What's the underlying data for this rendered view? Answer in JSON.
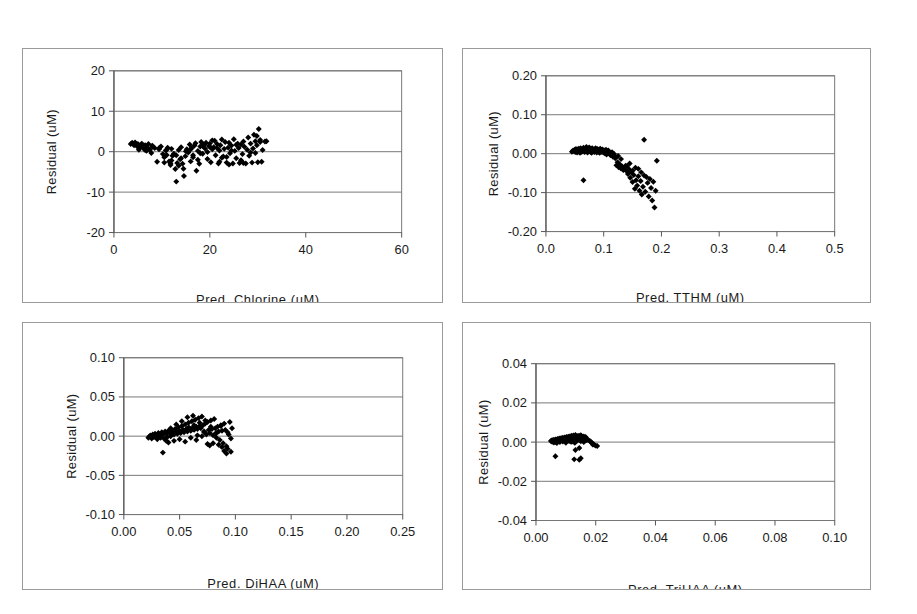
{
  "figure": {
    "background": "#ffffff",
    "panel_border_color": "#9a9a9a",
    "axis_color": "#555555",
    "gridline_color": "#777777",
    "marker_color": "#000000",
    "panel_count": 4
  },
  "chart_data": [
    {
      "id": "panel-chlorine",
      "type": "scatter",
      "title": "",
      "xlabel": "Pred. Chlorine (uM)",
      "ylabel": "Residual (uM)",
      "xlim": [
        0,
        60
      ],
      "ylim": [
        -20,
        20
      ],
      "xticks": [
        0,
        20,
        40,
        60
      ],
      "xticklabels": [
        "0",
        "20",
        "40",
        "60"
      ],
      "yticks": [
        -20,
        -10,
        0,
        10,
        20
      ],
      "yticklabels": [
        "-20",
        "-10",
        "0",
        "10",
        "20"
      ],
      "grid": "horizontal",
      "legend": "none",
      "x": [
        3.5,
        3.8,
        4.0,
        4.2,
        4.4,
        4.6,
        4.8,
        5.0,
        5.2,
        5.5,
        5.8,
        6.0,
        6.2,
        6.5,
        6.8,
        7.0,
        7.2,
        7.5,
        7.8,
        8.0,
        8.5,
        9.0,
        9.4,
        9.8,
        10.2,
        10.5,
        10.8,
        11.0,
        11.2,
        11.5,
        11.8,
        12.0,
        12.2,
        12.5,
        12.8,
        13.0,
        13.2,
        13.5,
        13.8,
        14.0,
        14.3,
        14.6,
        14.9,
        15.2,
        15.5,
        15.8,
        16.0,
        16.2,
        16.5,
        16.8,
        17.0,
        17.2,
        17.5,
        17.8,
        18.0,
        18.2,
        18.5,
        18.8,
        19.0,
        19.2,
        19.5,
        19.8,
        20.0,
        20.2,
        20.5,
        20.8,
        21.0,
        21.2,
        21.5,
        21.8,
        22.0,
        22.2,
        22.5,
        22.8,
        23.0,
        23.2,
        23.5,
        23.8,
        24.0,
        24.2,
        24.5,
        24.8,
        25.0,
        25.2,
        25.5,
        25.8,
        26.0,
        26.2,
        26.5,
        26.8,
        27.0,
        27.2,
        27.5,
        27.8,
        28.0,
        28.2,
        28.5,
        28.8,
        29.0,
        29.2,
        29.5,
        29.8,
        30.0,
        30.2,
        30.5,
        30.8,
        31.0,
        31.5,
        12.0,
        12.5,
        13.5,
        14.5,
        10.5,
        11.8,
        15.0,
        16.5,
        18.5,
        20.5,
        22.5,
        24.5,
        26.5,
        28.5,
        29.5,
        25.5,
        23.5,
        21.5,
        19.5,
        17.5,
        29.8,
        30.5,
        31.8,
        27.0,
        24.0,
        22.0,
        20.0,
        18.0,
        16.0,
        14.0,
        13.0,
        11.0,
        9.5,
        8.0,
        6.5,
        5.0,
        4.5
      ],
      "y": [
        1.9,
        2.2,
        2.0,
        1.6,
        2.3,
        1.8,
        1.4,
        1.9,
        0.5,
        1.1,
        2.0,
        1.3,
        0.8,
        1.6,
        0.2,
        1.0,
        1.9,
        0.4,
        -0.3,
        1.2,
        0.9,
        -2.5,
        0.6,
        1.3,
        -0.6,
        -1.4,
        0.3,
        -0.8,
        1.0,
        -2.4,
        -3.3,
        0.7,
        -1.0,
        -0.5,
        -4.3,
        -7.4,
        -2.8,
        0.4,
        -1.9,
        1.1,
        -3.0,
        -6.0,
        -1.1,
        0.6,
        -0.2,
        1.8,
        -2.4,
        0.9,
        -1.4,
        1.5,
        2.1,
        -4.7,
        0.2,
        -3.0,
        1.3,
        2.4,
        -0.5,
        1.7,
        0.8,
        2.2,
        -1.8,
        1.4,
        2.0,
        -2.6,
        0.6,
        1.1,
        2.7,
        -0.9,
        1.9,
        -2.9,
        0.3,
        1.6,
        3.0,
        -1.2,
        0.7,
        2.4,
        -2.7,
        1.0,
        2.2,
        -0.4,
        1.5,
        -2.9,
        3.1,
        0.2,
        -1.6,
        2.0,
        0.9,
        -2.8,
        1.8,
        -0.6,
        2.5,
        1.2,
        -2.9,
        0.5,
        3.5,
        -1.0,
        2.0,
        -2.7,
        0.8,
        4.2,
        -0.3,
        1.6,
        -2.6,
        5.6,
        2.9,
        -2.5,
        0.4,
        2.5,
        -2.2,
        -0.7,
        -3.5,
        -4.2,
        -2.7,
        -2.9,
        0.1,
        -0.9,
        1.4,
        2.8,
        -1.5,
        0.3,
        -2.1,
        -0.2,
        2.6,
        1.7,
        -1.3,
        0.9,
        -0.1,
        -2.0,
        3.9,
        2.4,
        2.6,
        -2.8,
        -3.2,
        -2.5,
        1.2,
        -0.4,
        0.6,
        -1.6,
        -0.9,
        0.5,
        1.0,
        1.5,
        0.4,
        1.2,
        2.1
      ],
      "marker": "diamond",
      "marker_size": 3
    },
    {
      "id": "panel-tthm",
      "type": "scatter",
      "title": "",
      "xlabel": "Pred. TTHM (uM)",
      "ylabel": "Residual (uM)",
      "xlim": [
        0.0,
        0.5
      ],
      "ylim": [
        -0.2,
        0.2
      ],
      "xticks": [
        0.0,
        0.1,
        0.2,
        0.3,
        0.4,
        0.5
      ],
      "xticklabels": [
        "0.0",
        "0.1",
        "0.2",
        "0.3",
        "0.4",
        "0.5"
      ],
      "yticks": [
        -0.2,
        -0.1,
        0.0,
        0.1,
        0.2
      ],
      "yticklabels": [
        "-0.20",
        "-0.10",
        "0.00",
        "0.10",
        "0.20"
      ],
      "grid": "horizontal",
      "legend": "none",
      "x": [
        0.045,
        0.047,
        0.049,
        0.05,
        0.051,
        0.052,
        0.053,
        0.054,
        0.055,
        0.056,
        0.057,
        0.058,
        0.059,
        0.06,
        0.061,
        0.062,
        0.063,
        0.064,
        0.065,
        0.066,
        0.067,
        0.068,
        0.069,
        0.07,
        0.071,
        0.072,
        0.073,
        0.074,
        0.075,
        0.076,
        0.077,
        0.078,
        0.079,
        0.08,
        0.081,
        0.082,
        0.083,
        0.084,
        0.085,
        0.086,
        0.087,
        0.088,
        0.089,
        0.09,
        0.091,
        0.092,
        0.093,
        0.094,
        0.095,
        0.096,
        0.097,
        0.098,
        0.099,
        0.1,
        0.101,
        0.102,
        0.103,
        0.104,
        0.105,
        0.106,
        0.107,
        0.108,
        0.11,
        0.112,
        0.114,
        0.116,
        0.118,
        0.12,
        0.122,
        0.124,
        0.126,
        0.128,
        0.13,
        0.132,
        0.134,
        0.136,
        0.138,
        0.14,
        0.142,
        0.144,
        0.146,
        0.148,
        0.15,
        0.152,
        0.154,
        0.156,
        0.158,
        0.16,
        0.162,
        0.164,
        0.166,
        0.168,
        0.17,
        0.172,
        0.174,
        0.176,
        0.178,
        0.18,
        0.182,
        0.184,
        0.186,
        0.188,
        0.19,
        0.192,
        0.155,
        0.145,
        0.135,
        0.125,
        0.115,
        0.105,
        0.095,
        0.085,
        0.075,
        0.065,
        0.17,
        0.165,
        0.16,
        0.15,
        0.14,
        0.13,
        0.12,
        0.11,
        0.1,
        0.09,
        0.08,
        0.07,
        0.06,
        0.055
      ],
      "y": [
        0.005,
        0.008,
        0.006,
        0.01,
        0.004,
        0.012,
        0.007,
        0.003,
        0.011,
        0.006,
        0.013,
        0.008,
        0.002,
        0.014,
        0.009,
        0.005,
        0.012,
        0.007,
        0.015,
        0.01,
        0.004,
        0.013,
        0.008,
        0.006,
        0.011,
        0.003,
        0.014,
        0.009,
        0.007,
        0.012,
        0.005,
        0.01,
        0.002,
        0.013,
        0.008,
        0.006,
        0.011,
        0.004,
        0.009,
        0.014,
        0.007,
        0.003,
        0.012,
        0.008,
        0.005,
        0.01,
        0.002,
        0.013,
        0.006,
        0.009,
        0.004,
        0.011,
        0.007,
        0.003,
        0.008,
        0.001,
        0.005,
        0.01,
        -0.002,
        0.006,
        0.002,
        0.008,
        0.0,
        -0.004,
        0.003,
        -0.008,
        -0.001,
        -0.012,
        -0.03,
        -0.022,
        -0.035,
        -0.028,
        -0.038,
        -0.033,
        -0.042,
        -0.036,
        -0.031,
        -0.045,
        -0.052,
        -0.04,
        -0.062,
        -0.048,
        -0.073,
        -0.055,
        -0.09,
        -0.068,
        -0.082,
        -0.058,
        -0.095,
        -0.07,
        -0.105,
        -0.085,
        0.036,
        -0.098,
        -0.06,
        -0.075,
        -0.11,
        -0.065,
        -0.088,
        -0.12,
        -0.072,
        -0.138,
        -0.095,
        -0.018,
        -0.036,
        -0.025,
        -0.041,
        -0.006,
        0.003,
        0.001,
        0.009,
        0.012,
        0.016,
        -0.068,
        -0.056,
        -0.048,
        -0.039,
        -0.044,
        -0.032,
        -0.014,
        -0.009,
        0.002,
        0.007,
        0.01,
        0.014,
        0.017,
        0.011
      ],
      "marker": "diamond",
      "marker_size": 3
    },
    {
      "id": "panel-dihaa",
      "type": "scatter",
      "title": "",
      "xlabel": "Pred. DiHAA (uM)",
      "ylabel": "Residual (uM)",
      "xlim": [
        0.0,
        0.25
      ],
      "ylim": [
        -0.1,
        0.1
      ],
      "xticks": [
        0.0,
        0.05,
        0.1,
        0.15,
        0.2,
        0.25
      ],
      "xticklabels": [
        "0.00",
        "0.05",
        "0.10",
        "0.15",
        "0.20",
        "0.25"
      ],
      "yticks": [
        -0.1,
        -0.05,
        0.0,
        0.05,
        0.1
      ],
      "yticklabels": [
        "-0.10",
        "-0.05",
        "0.00",
        "0.05",
        "0.10"
      ],
      "grid": "horizontal",
      "legend": "none",
      "x": [
        0.022,
        0.023,
        0.024,
        0.025,
        0.026,
        0.027,
        0.028,
        0.029,
        0.03,
        0.031,
        0.032,
        0.033,
        0.034,
        0.035,
        0.036,
        0.037,
        0.038,
        0.039,
        0.04,
        0.041,
        0.042,
        0.043,
        0.044,
        0.045,
        0.046,
        0.047,
        0.048,
        0.049,
        0.05,
        0.051,
        0.052,
        0.053,
        0.054,
        0.055,
        0.056,
        0.057,
        0.058,
        0.059,
        0.06,
        0.061,
        0.062,
        0.063,
        0.064,
        0.065,
        0.066,
        0.067,
        0.068,
        0.069,
        0.07,
        0.071,
        0.072,
        0.073,
        0.074,
        0.075,
        0.076,
        0.077,
        0.078,
        0.079,
        0.08,
        0.081,
        0.082,
        0.083,
        0.084,
        0.085,
        0.086,
        0.087,
        0.088,
        0.089,
        0.09,
        0.091,
        0.092,
        0.093,
        0.094,
        0.095,
        0.096,
        0.097,
        0.04,
        0.045,
        0.05,
        0.055,
        0.06,
        0.065,
        0.07,
        0.075,
        0.08,
        0.085,
        0.09,
        0.035,
        0.03,
        0.038,
        0.043,
        0.048,
        0.053,
        0.058,
        0.063,
        0.068,
        0.073,
        0.078,
        0.083,
        0.088,
        0.093,
        0.066,
        0.062,
        0.057,
        0.052,
        0.047,
        0.042,
        0.072,
        0.077,
        0.082,
        0.087,
        0.092,
        0.096
      ],
      "y": [
        -0.002,
        0.0,
        0.001,
        -0.003,
        0.002,
        -0.001,
        0.003,
        0.0,
        -0.004,
        0.004,
        0.001,
        -0.002,
        0.005,
        0.002,
        -0.003,
        0.006,
        0.003,
        -0.001,
        0.007,
        0.004,
        0.0,
        0.008,
        0.005,
        0.002,
        0.009,
        0.006,
        0.003,
        0.011,
        0.007,
        0.004,
        0.013,
        0.008,
        0.005,
        0.015,
        0.009,
        0.006,
        0.017,
        0.01,
        0.007,
        0.019,
        0.011,
        0.008,
        0.021,
        0.012,
        0.009,
        0.023,
        0.013,
        0.01,
        0.025,
        0.014,
        0.005,
        0.016,
        0.002,
        0.018,
        0.008,
        0.004,
        0.02,
        0.009,
        0.001,
        0.022,
        0.01,
        -0.002,
        0.012,
        0.006,
        -0.005,
        0.014,
        0.007,
        -0.009,
        0.016,
        0.008,
        -0.013,
        0.005,
        0.002,
        0.018,
        -0.003,
        0.01,
        -0.008,
        -0.006,
        -0.004,
        -0.007,
        -0.002,
        -0.005,
        0.0,
        -0.01,
        -0.009,
        -0.011,
        -0.019,
        -0.021,
        -0.001,
        -0.006,
        0.002,
        0.005,
        0.008,
        0.011,
        0.014,
        0.017,
        0.02,
        0.012,
        0.004,
        -0.014,
        -0.016,
        0.001,
        0.026,
        0.024,
        0.019,
        0.015,
        0.01,
        0.006,
        -0.012,
        0.003,
        0.013,
        -0.022,
        -0.02,
        0.002,
        0.0
      ],
      "marker": "diamond",
      "marker_size": 3
    },
    {
      "id": "panel-trihaa",
      "type": "scatter",
      "title": "",
      "xlabel": "Pred. TriHAA (uM)",
      "ylabel": "Residual (uM)",
      "xlim": [
        0.0,
        0.1
      ],
      "ylim": [
        -0.04,
        0.04
      ],
      "xticks": [
        0.0,
        0.02,
        0.04,
        0.06,
        0.08,
        0.1
      ],
      "xticklabels": [
        "0.00",
        "0.02",
        "0.04",
        "0.06",
        "0.08",
        "0.10"
      ],
      "yticks": [
        -0.04,
        -0.02,
        0.0,
        0.02,
        0.04
      ],
      "yticklabels": [
        "-0.04",
        "-0.02",
        "0.00",
        "0.02",
        "0.04"
      ],
      "grid": "horizontal",
      "legend": "none",
      "x": [
        0.005,
        0.0052,
        0.0054,
        0.0056,
        0.0058,
        0.006,
        0.0062,
        0.0064,
        0.0066,
        0.0068,
        0.007,
        0.0072,
        0.0074,
        0.0076,
        0.0078,
        0.008,
        0.0082,
        0.0084,
        0.0086,
        0.0088,
        0.009,
        0.0092,
        0.0094,
        0.0096,
        0.0098,
        0.01,
        0.0102,
        0.0104,
        0.0106,
        0.0108,
        0.011,
        0.0112,
        0.0114,
        0.0116,
        0.0118,
        0.012,
        0.0122,
        0.0124,
        0.0126,
        0.0128,
        0.013,
        0.0132,
        0.0134,
        0.0136,
        0.0138,
        0.014,
        0.0142,
        0.0144,
        0.0146,
        0.0148,
        0.015,
        0.0152,
        0.0154,
        0.0156,
        0.0158,
        0.016,
        0.0162,
        0.0164,
        0.0166,
        0.0168,
        0.017,
        0.0175,
        0.018,
        0.0185,
        0.019,
        0.0195,
        0.02,
        0.0205,
        0.006,
        0.007,
        0.008,
        0.009,
        0.01,
        0.011,
        0.012,
        0.013,
        0.014,
        0.015,
        0.016,
        0.017,
        0.018,
        0.019,
        0.0075,
        0.0085,
        0.0095,
        0.0105,
        0.0115,
        0.0125,
        0.0135,
        0.0145,
        0.0155,
        0.0165,
        0.0145,
        0.015,
        0.0065,
        0.0128,
        0.0132
      ],
      "y": [
        0.0005,
        0.0008,
        0.0002,
        0.001,
        0.0004,
        0.0012,
        0.0006,
        0.0001,
        0.0014,
        0.0007,
        0.0003,
        0.0016,
        0.0009,
        0.0005,
        0.0018,
        0.0011,
        0.0006,
        0.002,
        0.0013,
        0.0008,
        0.0022,
        0.0015,
        0.001,
        0.0024,
        0.0017,
        0.0012,
        0.0026,
        0.0019,
        0.0014,
        0.0028,
        0.0021,
        0.0016,
        0.003,
        0.0023,
        0.0018,
        0.0032,
        0.0025,
        0.002,
        0.0034,
        0.0027,
        0.0022,
        0.0036,
        0.0029,
        0.0024,
        0.0031,
        0.0026,
        0.0021,
        0.0033,
        0.0028,
        0.0023,
        0.0035,
        0.003,
        0.0025,
        0.0027,
        0.0022,
        0.0029,
        0.0024,
        0.0019,
        0.0026,
        0.0021,
        0.0016,
        0.001,
        0.0005,
        0.0,
        -0.0008,
        -0.0014,
        -0.0018,
        -0.002,
        -0.0002,
        -0.0005,
        0.0,
        0.0003,
        -0.0003,
        0.0007,
        0.0002,
        -0.0004,
        0.0009,
        0.0004,
        0.0001,
        0.0011,
        0.0006,
        -0.0012,
        0.0013,
        0.0018,
        0.0009,
        0.0015,
        0.0003,
        0.002,
        0.0012,
        -0.003,
        0.0024,
        0.0008,
        -0.009,
        -0.0082,
        -0.0072,
        -0.0088,
        -0.004
      ]
    }
  ],
  "panels": {
    "chlorine": {
      "xlabel": "Pred. Chlorine (uM)",
      "ylabel": "Residual (uM)",
      "xticklabels": [
        "0",
        "20",
        "40",
        "60"
      ],
      "yticklabels": [
        "20",
        "10",
        "0",
        "-10",
        "-20"
      ]
    },
    "tthm": {
      "xlabel": "Pred. TTHM (uM)",
      "ylabel": "Residual (uM)",
      "xticklabels": [
        "0.0",
        "0.1",
        "0.2",
        "0.3",
        "0.4",
        "0.5"
      ],
      "yticklabels": [
        "0.20",
        "0.10",
        "0.00",
        "-0.10",
        "-0.20"
      ]
    },
    "dihaa": {
      "xlabel": "Pred. DiHAA (uM)",
      "ylabel": "Residual (uM)",
      "xticklabels": [
        "0.00",
        "0.05",
        "0.10",
        "0.15",
        "0.20",
        "0.25"
      ],
      "yticklabels": [
        "0.10",
        "0.05",
        "0.00",
        "-0.05",
        "-0.10"
      ]
    },
    "trihaa": {
      "xlabel": "Pred. TriHAA (uM)",
      "ylabel": "Residual (uM)",
      "xticklabels": [
        "0.00",
        "0.02",
        "0.04",
        "0.06",
        "0.08",
        "0.10"
      ],
      "yticklabels": [
        "0.04",
        "0.02",
        "0.00",
        "-0.02",
        "-0.04"
      ]
    }
  }
}
